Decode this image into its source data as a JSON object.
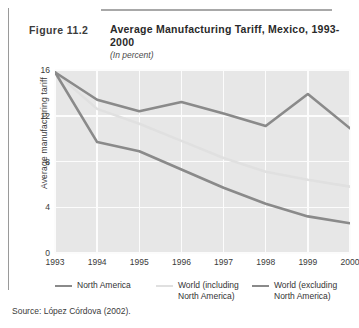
{
  "figure": {
    "number": "Figure 11.2",
    "title": "Average Manufacturing Tariff, Mexico, 1993-2000",
    "subtitle": "(In percent)",
    "source": "Source:  López Córdova (2002)."
  },
  "chart_data": {
    "type": "line",
    "title": "Average Manufacturing Tariff, Mexico, 1993-2000",
    "subtitle": "(In percent)",
    "xlabel": "",
    "ylabel": "Average manufacturing tariff",
    "x": [
      "1993",
      "1994",
      "1995",
      "1996",
      "1997",
      "1998",
      "1999",
      "2000"
    ],
    "xtick_labels": [
      "1993",
      "1994",
      "1995",
      "1996",
      "1997",
      "1998",
      "1999",
      "2000"
    ],
    "ytick_labels": [
      "0",
      "4",
      "8",
      "12",
      "16"
    ],
    "ytick_values": [
      0,
      4,
      8,
      12,
      16
    ],
    "ylim": [
      0,
      16
    ],
    "grid": true,
    "legend_position": "below",
    "series": [
      {
        "name": "North America",
        "label": "North America",
        "color": "#8a8a8a",
        "values": [
          15.8,
          9.7,
          8.9,
          7.3,
          5.7,
          4.3,
          3.2,
          2.6
        ]
      },
      {
        "name": "World (including North America)",
        "label": "World (including\nNorth America)",
        "color": "#e0e0e0",
        "values": [
          15.8,
          12.6,
          11.3,
          9.8,
          8.3,
          7.1,
          6.4,
          5.8
        ]
      },
      {
        "name": "World (excluding North America)",
        "label": "World (excluding\nNorth America)",
        "color": "#8a8a8a",
        "values": [
          15.8,
          13.4,
          12.4,
          13.2,
          12.2,
          11.1,
          13.9,
          10.9
        ]
      }
    ]
  }
}
